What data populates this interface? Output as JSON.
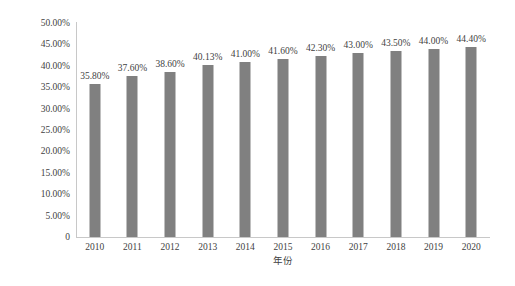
{
  "chart_data": {
    "type": "bar",
    "title": "",
    "subtitle": "",
    "xlabel": "年份",
    "ylabel": "",
    "categories": [
      "2010",
      "2011",
      "2012",
      "2013",
      "2014",
      "2015",
      "2016",
      "2017",
      "2018",
      "2019",
      "2020"
    ],
    "values": [
      35.8,
      37.6,
      38.6,
      40.13,
      41.0,
      41.6,
      42.3,
      43.0,
      43.5,
      44.0,
      44.4
    ],
    "value_labels": [
      "35.80%",
      "37.60%",
      "38.60%",
      "40.13%",
      "41.00%",
      "41.60%",
      "42.30%",
      "43.00%",
      "43.50%",
      "44.00%",
      "44.40%"
    ],
    "ylim": [
      0,
      50
    ],
    "y_ticks": [
      0,
      5,
      10,
      15,
      20,
      25,
      30,
      35,
      40,
      45,
      50
    ],
    "y_tick_labels": [
      "0",
      "5.00%",
      "10.00%",
      "15.00%",
      "20.00%",
      "25.00%",
      "30.00%",
      "35.00%",
      "40.00%",
      "45.00%",
      "50.00%"
    ],
    "grid": false,
    "legend": false,
    "legend_position": "none",
    "bar_color": "#808080",
    "axis_color": "#c8c8c8",
    "text_color": "#3f3f3f",
    "background_color": "#ffffff",
    "data_labels_shown": true
  }
}
